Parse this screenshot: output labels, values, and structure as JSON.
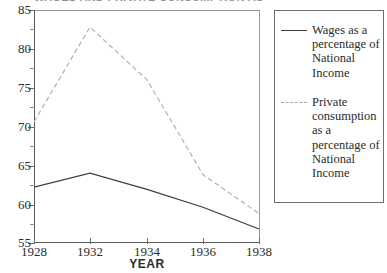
{
  "chart_data": {
    "type": "line",
    "title": "WAGES AND PRIVATE CONSUMPTION AS A PERCENTAGE OF NATIONAL INCOME",
    "xlabel": "YEAR",
    "ylabel": "",
    "categories": [
      "1928",
      "1932",
      "1934",
      "1936",
      "1938"
    ],
    "ylim": [
      55,
      85
    ],
    "yticks": [
      55,
      60,
      65,
      70,
      75,
      80,
      85
    ],
    "ytick_labels": [
      "55",
      "60",
      "65",
      "70",
      "75",
      "80",
      "85"
    ],
    "minor_yticks": [
      57.5,
      62.5,
      67.5,
      72.5,
      77.5,
      82.5
    ],
    "grid": false,
    "legend_position": "right",
    "series": [
      {
        "name": "Wages as a percentage of National Income",
        "style": "solid",
        "color": "#3d3d3d",
        "values": [
          62.2,
          64.0,
          61.9,
          59.6,
          56.8
        ]
      },
      {
        "name": "Private consumption as a percentage of National Income",
        "style": "dashed",
        "color": "#a9a9a9",
        "values": [
          70.6,
          82.8,
          76.0,
          63.8,
          58.8
        ]
      }
    ]
  },
  "axes": {
    "x_title": "YEAR",
    "y_tick_labels": [
      "85",
      "80",
      "75",
      "70",
      "65",
      "60",
      "55"
    ],
    "x_tick_labels": [
      "1928",
      "1932",
      "1934",
      "1936",
      "1938"
    ]
  },
  "legend": {
    "entries": [
      {
        "label": "Wages as a percentage of National Income",
        "style": "solid"
      },
      {
        "label": "Private consumption as a percentage of National Income",
        "style": "dashed"
      }
    ]
  }
}
